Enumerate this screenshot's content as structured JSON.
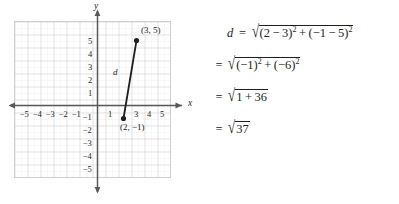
{
  "graph": {
    "x_axis_name": "x",
    "y_axis_name": "y",
    "x_tick_labels": [
      "−5",
      "−4",
      "−3",
      "−2",
      "−1",
      "1",
      "3",
      "4",
      "5"
    ],
    "y_tick_labels_positive": [
      "5",
      "4",
      "3",
      "2",
      "1"
    ],
    "y_tick_labels_negative": [
      "−1",
      "−2",
      "−3",
      "−4",
      "−5"
    ],
    "segment_label": "d",
    "point_a_label": "(2, −1)",
    "point_b_label": "(3, 5)",
    "points": [
      {
        "name": "point-a",
        "x": 2,
        "y": -1
      },
      {
        "name": "point-b",
        "x": 3,
        "y": 5
      }
    ],
    "x_range": [
      -6.4,
      6.6
    ],
    "y_range": [
      -6.5,
      6.5
    ],
    "grid": "on",
    "grid_color": "#c9c9cf",
    "minor_grid_color": "#e6e6ea",
    "axis_color": "#58585b",
    "segment_color": "#231f20"
  },
  "equations": {
    "line1": {
      "lhs": "d",
      "equals": "=",
      "radicand_parts": [
        "(2",
        "−",
        "3)",
        "2",
        "+",
        "(−1",
        "−",
        "5)",
        "2"
      ]
    },
    "line2": {
      "equals": "=",
      "radicand_parts": [
        "(−1)",
        "2",
        "+",
        "(−6)",
        "2"
      ]
    },
    "line3": {
      "equals": "=",
      "radicand_parts": [
        "1",
        "+",
        "36"
      ]
    },
    "line4": {
      "equals": "=",
      "radicand_parts": [
        "37"
      ]
    },
    "radical_sign": "√"
  }
}
